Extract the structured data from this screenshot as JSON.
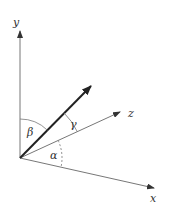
{
  "diagram": {
    "type": "direction-angles-3d",
    "origin": {
      "x": 20,
      "y": 158
    },
    "axes": [
      {
        "name": "y",
        "label": "y",
        "end": {
          "x": 20,
          "y": 30
        }
      },
      {
        "name": "z",
        "label": "z",
        "end": {
          "x": 120,
          "y": 112
        }
      },
      {
        "name": "x",
        "label": "x",
        "end": {
          "x": 155,
          "y": 188
        }
      }
    ],
    "vector": {
      "end": {
        "x": 91,
        "y": 85
      }
    },
    "angles": [
      {
        "name": "beta",
        "label": "β",
        "between": [
          "y",
          "vector"
        ]
      },
      {
        "name": "gamma",
        "label": "γ",
        "between": [
          "vector",
          "z"
        ]
      },
      {
        "name": "alpha",
        "label": "α",
        "between": [
          "z",
          "x"
        ],
        "style": "dashed"
      }
    ],
    "colors": {
      "axis": "#666666",
      "vector": "#222222",
      "label": "#333333"
    }
  }
}
